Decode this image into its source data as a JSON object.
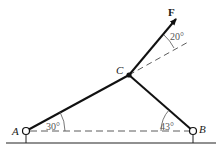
{
  "diagram": {
    "points": {
      "A": {
        "label": "A",
        "x": 26,
        "y": 131
      },
      "B": {
        "label": "B",
        "x": 193,
        "y": 131
      },
      "C": {
        "label": "C",
        "x": 129,
        "y": 75
      }
    },
    "force": {
      "label": "F",
      "tip_x": 177,
      "tip_y": 17
    },
    "angles": {
      "at_A": "30°",
      "at_B": "43°",
      "at_F": "20°"
    },
    "colors": {
      "member": "#111111",
      "dashed": "#333333",
      "angle_text": "#555555",
      "ground": "#222222"
    }
  }
}
